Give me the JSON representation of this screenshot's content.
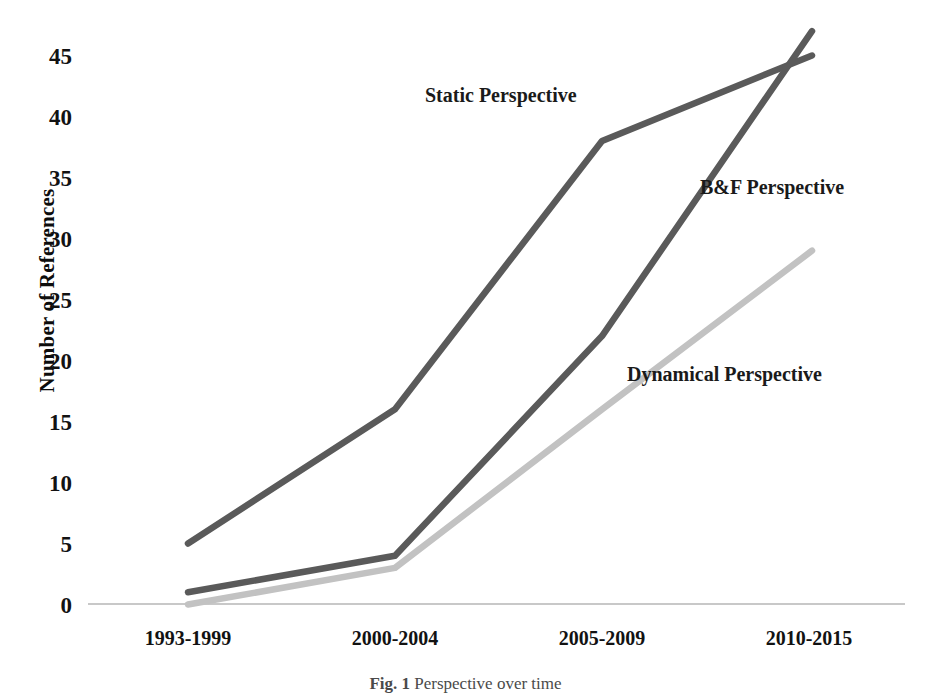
{
  "chart_data": {
    "type": "line",
    "title": "",
    "xlabel": "",
    "ylabel": "Number of References",
    "categories": [
      "1993-1999",
      "2000-2004",
      "2005-2009",
      "2010-2015"
    ],
    "ylim": [
      0,
      45
    ],
    "ytick_step": 5,
    "yticks": [
      "45",
      "40",
      "35",
      "30",
      "25",
      "20",
      "15",
      "10",
      "5",
      "0"
    ],
    "grid": false,
    "legend_position": "inline-annotations",
    "series": [
      {
        "name": "Static Perspective",
        "values": [
          5,
          16,
          38,
          45
        ],
        "color": "#5a5a5a"
      },
      {
        "name": "B&F Perspective",
        "values": [
          1,
          4,
          22,
          47
        ],
        "color": "#5a5a5a"
      },
      {
        "name": "Dynamical Perspective",
        "values": [
          0,
          3,
          16,
          29
        ],
        "color": "#c2c2c2"
      }
    ],
    "annotations": [
      {
        "text": "Static Perspective",
        "x": 425,
        "y": 84
      },
      {
        "text": "B&F Perspective",
        "x": 700,
        "y": 176
      },
      {
        "text": "Dynamical Perspective",
        "x": 627,
        "y": 363
      }
    ]
  },
  "caption": {
    "figure_number": "Fig. 1",
    "text": "Perspective over time"
  },
  "colors": {
    "axis": "#b0b0b0",
    "text": "#121212",
    "static_series": "#5a5a5a",
    "bf_series": "#5a5a5a",
    "dynamical_series": "#c2c2c2"
  }
}
